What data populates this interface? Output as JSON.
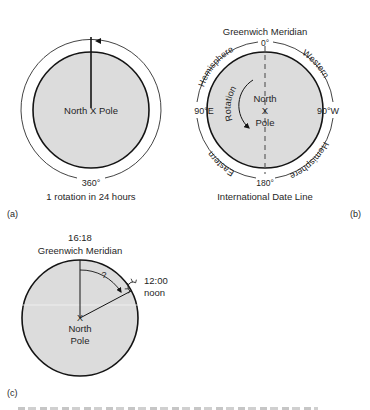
{
  "colors": {
    "disc_fill": "#dcdcdc",
    "stroke": "#141414",
    "text": "#1f1f1f",
    "background": "#ffffff"
  },
  "panel_a": {
    "panel_label": "(a)",
    "center_label_left": "North",
    "center_mark": "X",
    "center_label_right": "Pole",
    "ring_label": "360°",
    "caption": "1 rotation in 24 hours"
  },
  "panel_b": {
    "panel_label": "(b)",
    "top_title": "Greenwich Meridian",
    "top_degree": "0°",
    "left_degree": "90°E",
    "right_degree": "90°W",
    "bottom_degree": "180°",
    "bottom_title": "International Date Line",
    "arc_top_left": "Hemisphere",
    "arc_top_right": "Western",
    "arc_bottom_left": "Eastern",
    "arc_bottom_right": "Hemisphere",
    "rotation_label": "Rotation",
    "center_line1": "North",
    "center_mark": "X",
    "center_line2": "Pole"
  },
  "panel_c": {
    "panel_label": "(c)",
    "top_time": "16:18",
    "top_title": "Greenwich Meridian",
    "angle_label": "?",
    "right_time": "12:00",
    "right_label": "noon",
    "sun_icon": "sun-icon",
    "center_mark": "X",
    "center_line1": "North",
    "center_line2": "Pole"
  }
}
